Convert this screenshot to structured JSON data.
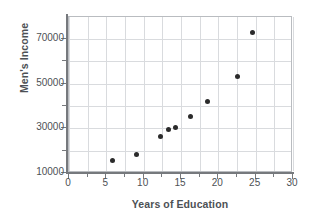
{
  "chart_data": {
    "type": "scatter",
    "title": "",
    "xlabel": "Years of Education",
    "ylabel": "Men's Income",
    "xlim": [
      0,
      30
    ],
    "ylim": [
      10000,
      78000
    ],
    "grid": true,
    "legend": false,
    "xticks": [
      0,
      5,
      10,
      15,
      20,
      25,
      30
    ],
    "xtick_labels": [
      "0",
      "5",
      "10",
      "15",
      "20",
      "25",
      "30"
    ],
    "yticks": [
      10000,
      30000,
      50000,
      70000
    ],
    "ytick_labels": [
      "10000",
      "30000",
      "50000",
      "70000"
    ],
    "minor_gridlines_x": [
      0,
      2.5,
      5,
      7.5,
      10,
      12.5,
      15,
      17.5,
      20,
      22.5,
      25,
      27.5,
      30
    ],
    "minor_gridlines_y": [
      10000,
      20000,
      30000,
      40000,
      50000,
      60000,
      70000
    ],
    "x": [
      5.8,
      9.0,
      12.3,
      13.3,
      14.2,
      16.3,
      18.6,
      22.6,
      24.6
    ],
    "y": [
      15500,
      18500,
      26500,
      29500,
      30500,
      35500,
      42000,
      53000,
      73000
    ],
    "points": [
      {
        "x": 5.8,
        "y": 15500
      },
      {
        "x": 9.0,
        "y": 18500
      },
      {
        "x": 12.3,
        "y": 26500
      },
      {
        "x": 13.3,
        "y": 29500
      },
      {
        "x": 14.2,
        "y": 30500
      },
      {
        "x": 16.3,
        "y": 35500
      },
      {
        "x": 18.6,
        "y": 42000
      },
      {
        "x": 22.6,
        "y": 53000
      },
      {
        "x": 24.6,
        "y": 73000
      }
    ],
    "marker": {
      "shape": "circle",
      "color": "#2b2b2b",
      "size": 5
    },
    "colors": {
      "axis": "#76797d",
      "grid": "#d9dbde",
      "frame": "#b9bcc0",
      "text": "#4d5155",
      "background": "#ffffff"
    }
  }
}
